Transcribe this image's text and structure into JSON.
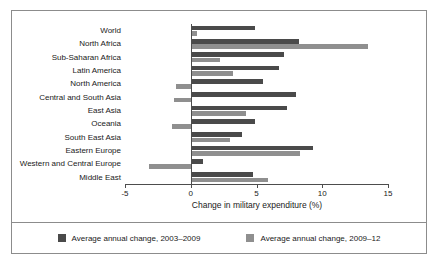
{
  "chart_data": {
    "type": "bar",
    "orientation": "horizontal",
    "title": "",
    "xlabel": "Change in military expenditure (%)",
    "ylabel": "",
    "xlim": [
      -5,
      15
    ],
    "xticks": [
      -5,
      0,
      5,
      10,
      15
    ],
    "xtick_labels": [
      "-5",
      "0",
      "5",
      "10",
      "15"
    ],
    "grid": false,
    "legend_position": "bottom",
    "categories": [
      "World",
      "North Africa",
      "Sub-Saharan Africa",
      "Latin America",
      "North America",
      "Central and South Asia",
      "East Asia",
      "Oceania",
      "South East Asia",
      "Eastern Europe",
      "Western and Central Europe",
      "Middle East"
    ],
    "series": [
      {
        "name": "Average annual change, 2003–2009",
        "color": "#4a4a4a",
        "values": [
          4.9,
          8.2,
          7.1,
          6.7,
          5.5,
          8.0,
          7.3,
          4.9,
          3.9,
          9.3,
          0.9,
          4.7
        ]
      },
      {
        "name": "Average annual change, 2009–12",
        "color": "#8f8f8f",
        "values": [
          0.5,
          13.5,
          2.2,
          3.2,
          -1.1,
          -1.3,
          4.2,
          -1.4,
          3.0,
          8.3,
          -3.2,
          5.9
        ]
      }
    ]
  },
  "legend": {
    "items": [
      {
        "label": "Average annual change, 2003–2009",
        "color": "#4a4a4a"
      },
      {
        "label": "Average annual change, 2009–12",
        "color": "#8f8f8f"
      }
    ]
  }
}
